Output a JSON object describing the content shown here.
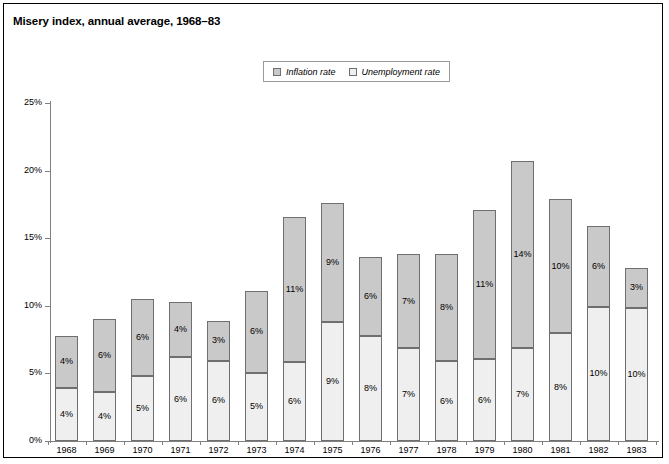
{
  "chart_data": {
    "type": "bar",
    "subtype": "stacked-vertical",
    "title": "Misery index, annual average, 1968–83",
    "xlabel": "",
    "ylabel": "",
    "ylim": [
      0,
      25
    ],
    "ytick_labels": [
      "25%",
      "20%",
      "15%",
      "10%",
      "5%",
      "0%"
    ],
    "ytick_values": [
      25,
      20,
      15,
      10,
      5,
      0
    ],
    "grid": false,
    "legend_position": "top-center",
    "categories": [
      "1968",
      "1969",
      "1970",
      "1971",
      "1972",
      "1973",
      "1974",
      "1975",
      "1976",
      "1977",
      "1978",
      "1979",
      "1980",
      "1981",
      "1982",
      "1983"
    ],
    "series": [
      {
        "name": "Unemployment rate",
        "color": "#efefef",
        "values": [
          4,
          4,
          5,
          6,
          6,
          5,
          6,
          9,
          8,
          7,
          6,
          6,
          7,
          8,
          10,
          10
        ],
        "labels": [
          "4%",
          "4%",
          "5%",
          "6%",
          "6%",
          "5%",
          "6%",
          "9%",
          "8%",
          "7%",
          "6%",
          "6%",
          "7%",
          "8%",
          "10%",
          "10%"
        ]
      },
      {
        "name": "Inflation rate",
        "color": "#c9c9c9",
        "values": [
          4,
          6,
          6,
          4,
          3,
          6,
          11,
          9,
          6,
          7,
          8,
          11,
          14,
          10,
          6,
          3
        ],
        "labels": [
          "4%",
          "6%",
          "6%",
          "4%",
          "3%",
          "6%",
          "11%",
          "9%",
          "6%",
          "7%",
          "8%",
          "11%",
          "14%",
          "10%",
          "6%",
          "3%"
        ]
      }
    ],
    "totals": [
      7.8,
      9.0,
      10.5,
      10.3,
      8.9,
      11.1,
      16.6,
      17.6,
      13.6,
      13.8,
      13.8,
      17.1,
      20.7,
      17.9,
      15.9,
      12.8
    ],
    "stack_order": [
      "Unemployment rate",
      "Inflation rate"
    ]
  },
  "legend": {
    "entries": [
      {
        "label": "Inflation rate",
        "color": "#c9c9c9"
      },
      {
        "label": "Unemployment rate",
        "color": "#efefef"
      }
    ]
  }
}
